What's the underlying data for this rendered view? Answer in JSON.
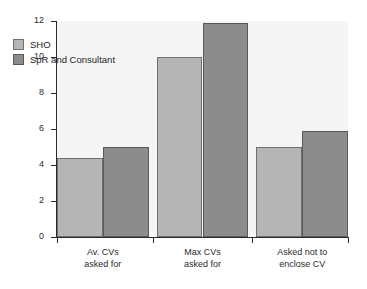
{
  "chart_data": {
    "type": "bar",
    "title": "",
    "subtitle": "",
    "xlabel": "",
    "ylabel": "",
    "categories": [
      "Av. CVs asked for",
      "Max CVs asked for",
      "Asked not to enclose CV"
    ],
    "category_lines": [
      [
        "Av. CVs",
        "asked for"
      ],
      [
        "Max CVs",
        "asked for"
      ],
      [
        "Asked not to",
        "enclose CV"
      ]
    ],
    "series": [
      {
        "name": "SHO",
        "color": "#b5b5b5",
        "values": [
          4.4,
          10.0,
          5.0
        ]
      },
      {
        "name": "SpR and Consultant",
        "color": "#8c8c8c",
        "values": [
          5.0,
          11.9,
          5.9
        ]
      }
    ],
    "ylim": [
      0,
      12
    ],
    "yticks": [
      0,
      2,
      4,
      6,
      8,
      10,
      12
    ],
    "ytick_labels": [
      "0",
      "2",
      "4",
      "6",
      "8",
      "10",
      "12"
    ],
    "grid": false,
    "legend_position": "upper-left-inside",
    "plot_background": "#f5f5f5",
    "axis_color": "#2b2b2b"
  },
  "legend": {
    "entries": [
      {
        "label": "SHO"
      },
      {
        "label": "SpR and Consultant"
      }
    ]
  }
}
